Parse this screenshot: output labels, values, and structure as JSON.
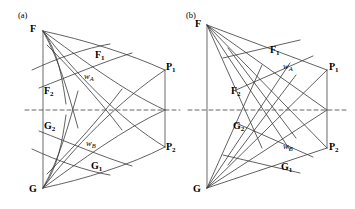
{
  "figure": {
    "background": "#ffffff",
    "stroke_color": "#3a3a3a",
    "axis_color": "#555555",
    "dash_color": "#555555",
    "width": 355,
    "height": 209
  },
  "panels": [
    {
      "tag": "(a)",
      "tag_pos": {
        "x": 18,
        "y": 11
      },
      "type": "curvilinear",
      "labels": {
        "F": {
          "text": "F",
          "sub": "",
          "x": 30,
          "y": 24
        },
        "G": {
          "text": "G",
          "sub": "",
          "x": 29,
          "y": 184
        },
        "P1": {
          "text": "P",
          "sub": "1",
          "x": 166,
          "y": 62
        },
        "P2": {
          "text": "P",
          "sub": "2",
          "x": 166,
          "y": 142
        },
        "F1": {
          "text": "F",
          "sub": "1",
          "x": 95,
          "y": 50
        },
        "F2": {
          "text": "F",
          "sub": "2",
          "x": 44,
          "y": 86
        },
        "G2": {
          "text": "G",
          "sub": "2",
          "x": 44,
          "y": 121
        },
        "G1": {
          "text": "G",
          "sub": "1",
          "x": 91,
          "y": 161
        },
        "wA": {
          "text": "w",
          "sub": "A",
          "x": 84,
          "y": 72
        },
        "wB": {
          "text": "w",
          "sub": "B",
          "x": 86,
          "y": 139
        }
      },
      "geometry": {
        "F": {
          "x": 43,
          "y": 31
        },
        "G": {
          "x": 43,
          "y": 188
        },
        "P1": {
          "x": 165,
          "y": 70
        },
        "P2": {
          "x": 165,
          "y": 147
        },
        "M": {
          "x": 165,
          "y": 110
        },
        "axis_y": 110
      }
    },
    {
      "tag": "(b)",
      "tag_pos": {
        "x": 186,
        "y": 11
      },
      "type": "rectilinear",
      "labels": {
        "F": {
          "text": "F",
          "sub": "",
          "x": 195,
          "y": 19
        },
        "G": {
          "text": "G",
          "sub": "",
          "x": 193,
          "y": 184
        },
        "P1": {
          "text": "P",
          "sub": "1",
          "x": 329,
          "y": 62
        },
        "P2": {
          "text": "P",
          "sub": "2",
          "x": 329,
          "y": 142
        },
        "F1": {
          "text": "F",
          "sub": "1",
          "x": 270,
          "y": 45
        },
        "F2": {
          "text": "F",
          "sub": "2",
          "x": 231,
          "y": 86
        },
        "G2": {
          "text": "G",
          "sub": "2",
          "x": 233,
          "y": 121
        },
        "G1": {
          "text": "G",
          "sub": "1",
          "x": 281,
          "y": 162
        },
        "wA": {
          "text": "w",
          "sub": "A",
          "x": 283,
          "y": 62
        },
        "wB": {
          "text": "w",
          "sub": "B",
          "x": 283,
          "y": 142
        }
      },
      "geometry": {
        "F": {
          "x": 207,
          "y": 25
        },
        "G": {
          "x": 207,
          "y": 188
        },
        "P1": {
          "x": 327,
          "y": 70
        },
        "P2": {
          "x": 327,
          "y": 148
        },
        "M": {
          "x": 327,
          "y": 110
        },
        "axis_y": 110
      }
    }
  ],
  "dashed_axis": {
    "a": {
      "x1": 25,
      "x2": 180,
      "y": 110
    },
    "b": {
      "x1": 188,
      "x2": 348,
      "y": 110
    }
  }
}
